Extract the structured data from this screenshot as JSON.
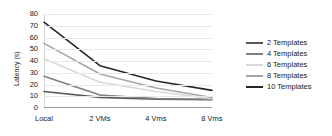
{
  "chart_data": {
    "type": "line",
    "title": "",
    "xlabel": "",
    "ylabel": "Latency (s)",
    "categories": [
      "Local",
      "2 VMs",
      "4 Vms",
      "8 Vms"
    ],
    "ylim": [
      0,
      80
    ],
    "yticks": [
      0,
      10,
      20,
      30,
      40,
      50,
      60,
      70,
      80
    ],
    "grid": true,
    "legend_position": "right",
    "series": [
      {
        "name": "2 Templates",
        "values": [
          14,
          9,
          7.5,
          7
        ],
        "color": "#595959"
      },
      {
        "name": "4 Templates",
        "values": [
          27,
          11,
          8,
          7.5
        ],
        "color": "#808080"
      },
      {
        "name": "6 Templates",
        "values": [
          42,
          22,
          14,
          8
        ],
        "color": "#d9d9d9"
      },
      {
        "name": "8 Templates",
        "values": [
          55,
          29,
          17,
          9
        ],
        "color": "#a6a6a6"
      },
      {
        "name": "10 Templates",
        "values": [
          73,
          36,
          23,
          15
        ],
        "color": "#262626"
      }
    ]
  }
}
